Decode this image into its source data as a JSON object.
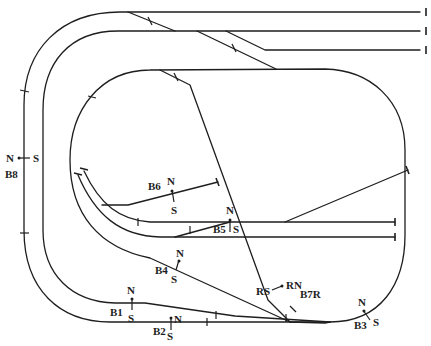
{
  "diagram": {
    "colors": {
      "line": "#1e1e1e",
      "background": "#ffffff"
    },
    "blocks": {
      "b1": {
        "name": "B1",
        "n": "N",
        "s": "S"
      },
      "b2": {
        "name": "B2",
        "n": "N",
        "s": "S"
      },
      "b3": {
        "name": "B3",
        "n": "N",
        "s": "S"
      },
      "b4": {
        "name": "B4",
        "n": "N",
        "s": "S"
      },
      "b5": {
        "name": "B5",
        "n": "N",
        "s": "S"
      },
      "b6": {
        "name": "B6",
        "n": "N",
        "s": "S"
      },
      "b7r": {
        "name": "B7R",
        "n": "RN",
        "s": "RS"
      },
      "b8": {
        "name": "B8",
        "n": "N",
        "s": "S"
      }
    }
  }
}
